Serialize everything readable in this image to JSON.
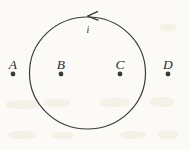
{
  "figure": {
    "background_color": "#fbfaf7",
    "ink_color": "#3a3a3a",
    "canvas": {
      "width": 189,
      "height": 150
    },
    "loop": {
      "name": "current-carrying-circular-loop",
      "shape": "circle",
      "center_x": 87.5,
      "center_y": 73,
      "radius_x": 58,
      "radius_y": 56,
      "stroke_width": 1.2
    },
    "current": {
      "label": "i",
      "label_x": 88,
      "label_y": 25,
      "direction": "counterclockwise",
      "arrow_tip_x": 88,
      "arrow_tip_y": 16
    },
    "points": [
      {
        "label": "A",
        "x": 13,
        "label_y": 58,
        "dot_y": 74,
        "inside_loop": false
      },
      {
        "label": "B",
        "x": 61,
        "label_y": 58,
        "dot_y": 74,
        "inside_loop": true
      },
      {
        "label": "C",
        "x": 120,
        "label_y": 58,
        "dot_y": 74,
        "inside_loop": true
      },
      {
        "label": "D",
        "x": 168,
        "label_y": 58,
        "dot_y": 74,
        "inside_loop": false
      }
    ]
  },
  "chart_data": {
    "type": "diagram",
    "title": "",
    "categories": [
      "A",
      "B",
      "C",
      "D"
    ],
    "values": [
      13,
      61,
      120,
      168
    ],
    "xlabel": "",
    "ylabel": "",
    "annotations": [
      "i"
    ],
    "legend": []
  }
}
